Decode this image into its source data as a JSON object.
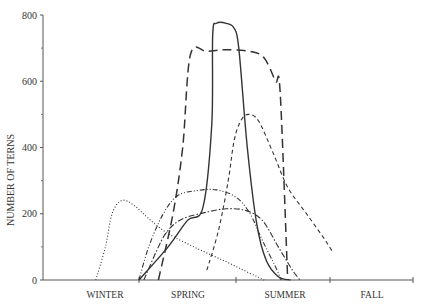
{
  "chart_data": {
    "type": "line",
    "title": "",
    "xlabel": "",
    "ylabel": "NUMBER OF TERNS",
    "ylim": [
      0,
      800
    ],
    "yticks": [
      0,
      200,
      400,
      600,
      800
    ],
    "ytick_minor": [
      100,
      300,
      500,
      700
    ],
    "categories": [
      "WINTER",
      "SPRING",
      "SUMMER",
      "FALL"
    ],
    "x_description": "Seasonal time axis (fractional position: 0=start of winter, 1=end of winter/start of spring, 2=start of summer, 3=start of fall, 4=end of fall)",
    "grid": false,
    "legend": "none",
    "series": [
      {
        "name": "solid",
        "style": "solid",
        "points": [
          [
            1.0,
            0
          ],
          [
            1.3,
            100
          ],
          [
            1.5,
            180
          ],
          [
            1.66,
            220
          ],
          [
            1.75,
            470
          ],
          [
            1.76,
            740
          ],
          [
            1.8,
            775
          ],
          [
            1.9,
            775
          ],
          [
            1.98,
            760
          ],
          [
            2.03,
            700
          ],
          [
            2.12,
            400
          ],
          [
            2.22,
            170
          ],
          [
            2.32,
            60
          ],
          [
            2.45,
            10
          ],
          [
            2.58,
            0
          ]
        ]
      },
      {
        "name": "long-dash",
        "style": "long-dash",
        "points": [
          [
            1.2,
            0
          ],
          [
            1.35,
            200
          ],
          [
            1.45,
            400
          ],
          [
            1.53,
            680
          ],
          [
            1.7,
            690
          ],
          [
            1.9,
            695
          ],
          [
            2.15,
            690
          ],
          [
            2.3,
            670
          ],
          [
            2.42,
            600
          ],
          [
            2.47,
            565
          ],
          [
            2.55,
            0
          ]
        ]
      },
      {
        "name": "short-dash",
        "style": "short-dash",
        "points": [
          [
            1.7,
            30
          ],
          [
            1.82,
            150
          ],
          [
            1.92,
            300
          ],
          [
            1.98,
            420
          ],
          [
            2.05,
            480
          ],
          [
            2.13,
            500
          ],
          [
            2.24,
            480
          ],
          [
            2.4,
            380
          ],
          [
            2.55,
            280
          ],
          [
            2.75,
            200
          ],
          [
            2.95,
            120
          ],
          [
            3.03,
            85
          ]
        ]
      },
      {
        "name": "dotted",
        "style": "dotted",
        "points": [
          [
            0.55,
            0
          ],
          [
            0.65,
            100
          ],
          [
            0.72,
            200
          ],
          [
            0.82,
            240
          ],
          [
            0.95,
            225
          ],
          [
            1.1,
            185
          ],
          [
            1.3,
            140
          ],
          [
            1.6,
            95
          ],
          [
            1.9,
            55
          ],
          [
            2.15,
            20
          ],
          [
            2.3,
            0
          ]
        ]
      },
      {
        "name": "dash-dot-dot",
        "style": "dash-dot-dot",
        "points": [
          [
            1.0,
            0
          ],
          [
            1.1,
            100
          ],
          [
            1.25,
            200
          ],
          [
            1.4,
            255
          ],
          [
            1.6,
            270
          ],
          [
            1.8,
            272
          ],
          [
            2.0,
            250
          ],
          [
            2.15,
            200
          ],
          [
            2.28,
            120
          ],
          [
            2.42,
            40
          ],
          [
            2.48,
            0
          ]
        ]
      },
      {
        "name": "dash-dot",
        "style": "dash-dot",
        "points": [
          [
            1.05,
            0
          ],
          [
            1.2,
            100
          ],
          [
            1.3,
            150
          ],
          [
            1.45,
            185
          ],
          [
            1.7,
            205
          ],
          [
            1.9,
            215
          ],
          [
            2.1,
            210
          ],
          [
            2.28,
            180
          ],
          [
            2.45,
            100
          ],
          [
            2.6,
            30
          ],
          [
            2.68,
            0
          ]
        ]
      }
    ]
  },
  "axis": {
    "y_label": "NUMBER OF TERNS",
    "y_ticks": [
      "0",
      "200",
      "400",
      "600",
      "800"
    ],
    "x_labels": [
      "WINTER",
      "SPRING",
      "SUMMER",
      "FALL"
    ]
  }
}
